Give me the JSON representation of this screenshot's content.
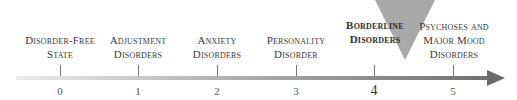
{
  "diagram": {
    "type": "continuum",
    "highlight_index": 4,
    "highlight_color": "#a9a9a9",
    "points": [
      {
        "value": "0",
        "lines": [
          "Disorder-Free",
          "State"
        ]
      },
      {
        "value": "1",
        "lines": [
          "Adjustment",
          "Disorders"
        ]
      },
      {
        "value": "2",
        "lines": [
          "Anxiety",
          "Disorders"
        ]
      },
      {
        "value": "3",
        "lines": [
          "Personality",
          "Disorder"
        ]
      },
      {
        "value": "4",
        "lines": [
          "Borderline",
          "Disorders"
        ]
      },
      {
        "value": "5",
        "lines": [
          "Psychoses and",
          "Major Mood",
          "Disorders"
        ]
      }
    ]
  }
}
